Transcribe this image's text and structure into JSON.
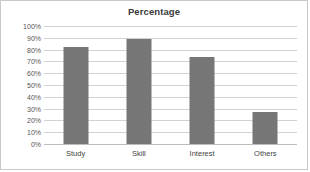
{
  "chart_data": {
    "type": "bar",
    "title": "Percentage",
    "xlabel": "",
    "ylabel": "",
    "categories": [
      "Study",
      "Skill",
      "Interest",
      "Others"
    ],
    "values": [
      82,
      89,
      74,
      27
    ],
    "value_labels": [
      "82%",
      "89%",
      "74%",
      "27%"
    ],
    "ylim": [
      0,
      100
    ],
    "ytick_labels": [
      "100%",
      "90%",
      "80%",
      "70%",
      "60%",
      "50%",
      "40%",
      "30%",
      "20%",
      "10%",
      "0%"
    ],
    "ytick_values": [
      100,
      90,
      80,
      70,
      60,
      50,
      40,
      30,
      20,
      10,
      0
    ],
    "grid": true,
    "legend": false,
    "legend_position": "none",
    "series_color": "#767676",
    "gridline_color": "#d2d2d2",
    "border_color": "#c9c9c9"
  }
}
